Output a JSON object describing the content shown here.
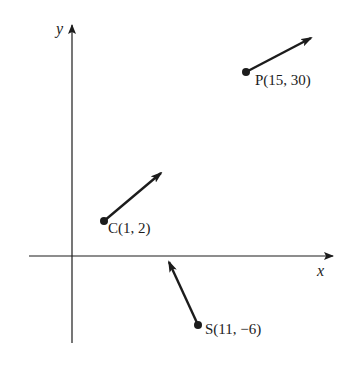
{
  "figure": {
    "type": "vector-diagram",
    "axes": {
      "x_label": "x",
      "y_label": "y",
      "origin_px": [
        72,
        256
      ],
      "x_axis_px": {
        "from": [
          29,
          256
        ],
        "to": [
          333,
          256
        ]
      },
      "y_axis_px": {
        "from": [
          72,
          343
        ],
        "to": [
          72,
          25
        ]
      }
    },
    "points": [
      {
        "id": "P",
        "label": "P(15, 30)",
        "x": 15,
        "y": 30,
        "dot_px": [
          246,
          72
        ],
        "arrow_to_px": [
          311,
          38
        ],
        "label_px": [
          255,
          85
        ]
      },
      {
        "id": "C",
        "label": "C(1, 2)",
        "x": 1,
        "y": 2,
        "dot_px": [
          104,
          221
        ],
        "arrow_to_px": [
          161,
          173
        ],
        "label_px": [
          108,
          233
        ]
      },
      {
        "id": "S",
        "label": "S(11, −6)",
        "x": 11,
        "y": -6,
        "dot_px": [
          198,
          325
        ],
        "arrow_to_px": [
          169,
          262
        ],
        "label_px": [
          205,
          334
        ]
      }
    ],
    "colors": {
      "ink": "#1c1c1c",
      "background": "#ffffff"
    }
  }
}
